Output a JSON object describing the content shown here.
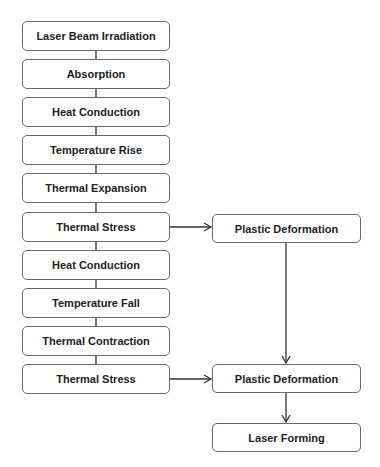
{
  "diagram": {
    "type": "flowchart",
    "left_column": [
      {
        "id": "n1",
        "label": "Laser Beam Irradiation"
      },
      {
        "id": "n2",
        "label": "Absorption"
      },
      {
        "id": "n3",
        "label": "Heat Conduction"
      },
      {
        "id": "n4",
        "label": "Temperature Rise"
      },
      {
        "id": "n5",
        "label": "Thermal Expansion"
      },
      {
        "id": "n6",
        "label": "Thermal Stress"
      },
      {
        "id": "n7",
        "label": "Heat Conduction"
      },
      {
        "id": "n8",
        "label": "Temperature Fall"
      },
      {
        "id": "n9",
        "label": "Thermal Contraction"
      },
      {
        "id": "n10",
        "label": "Thermal Stress"
      }
    ],
    "right_column": [
      {
        "id": "r1",
        "label": "Plastic Deformation"
      },
      {
        "id": "r2",
        "label": "Plastic Deformation"
      },
      {
        "id": "r3",
        "label": "Laser Forming"
      }
    ],
    "edges": [
      {
        "from": "n1",
        "to": "n2",
        "arrow": false
      },
      {
        "from": "n2",
        "to": "n3",
        "arrow": false
      },
      {
        "from": "n3",
        "to": "n4",
        "arrow": false
      },
      {
        "from": "n4",
        "to": "n5",
        "arrow": false
      },
      {
        "from": "n5",
        "to": "n6",
        "arrow": false
      },
      {
        "from": "n6",
        "to": "n7",
        "arrow": false
      },
      {
        "from": "n7",
        "to": "n8",
        "arrow": false
      },
      {
        "from": "n8",
        "to": "n9",
        "arrow": false
      },
      {
        "from": "n9",
        "to": "n10",
        "arrow": false
      },
      {
        "from": "n6",
        "to": "r1",
        "arrow": true
      },
      {
        "from": "n10",
        "to": "r2",
        "arrow": true
      },
      {
        "from": "r1",
        "to": "r2",
        "arrow": true
      },
      {
        "from": "r2",
        "to": "r3",
        "arrow": true
      }
    ],
    "colors": {
      "node_border": "#6a6a6a",
      "node_fill": "#ffffff",
      "text": "#222222",
      "connector": "#333333"
    }
  }
}
